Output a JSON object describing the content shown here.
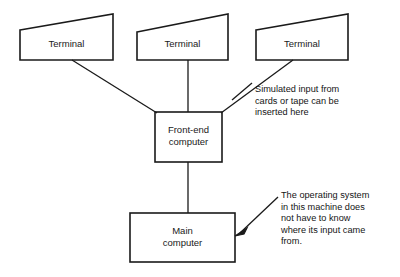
{
  "diagram": {
    "background_color": "#ffffff",
    "stroke_color": "#1a1a1a",
    "nodes": [
      {
        "id": "terminal-1",
        "label": "Terminal",
        "shape": "trapezoid"
      },
      {
        "id": "terminal-2",
        "label": "Terminal",
        "shape": "trapezoid"
      },
      {
        "id": "terminal-3",
        "label": "Terminal",
        "shape": "trapezoid"
      },
      {
        "id": "frontend-computer",
        "label": "Front-end\ncomputer",
        "shape": "rectangle"
      },
      {
        "id": "main-computer",
        "label": "Main\ncomputer",
        "shape": "rectangle"
      }
    ],
    "annotations": [
      {
        "id": "simulated-input",
        "text": "Simulated input from\ncards or tape can be\ninserted here",
        "points_to": "frontend-computer"
      },
      {
        "id": "operating-system",
        "text": "The operating system\nin this machine does\nnot have to know\nwhere its input came\nfrom.",
        "points_to": "main-computer"
      }
    ],
    "connectors": [
      {
        "from": "terminal-1",
        "to": "frontend-computer",
        "style": "diagonal-line"
      },
      {
        "from": "terminal-2",
        "to": "frontend-computer",
        "style": "vertical-line"
      },
      {
        "from": "terminal-3",
        "to": "frontend-computer",
        "style": "diagonal-line"
      },
      {
        "from": "frontend-computer",
        "to": "main-computer",
        "style": "vertical-line"
      }
    ]
  }
}
